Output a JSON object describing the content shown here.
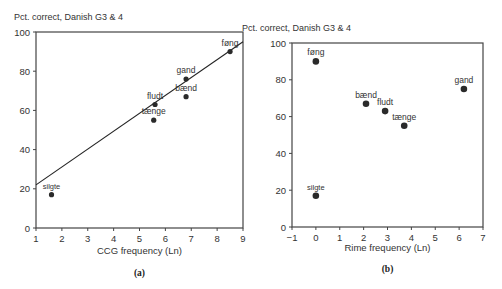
{
  "chart_data": [
    {
      "id": "a",
      "type": "scatter",
      "title": "Pct. correct, Danish G3 & 4",
      "xlabel": "CCG frequency (Ln)",
      "ylabel": "Pct. correct, Danish G3 & 4",
      "caption": "(a)",
      "xlim": [
        1,
        9
      ],
      "ylim": [
        0,
        100
      ],
      "xticks": [
        "1",
        "2",
        "3",
        "4",
        "5",
        "6",
        "7",
        "8",
        "9"
      ],
      "yticks": [
        "0",
        "20",
        "40",
        "60",
        "80",
        "100"
      ],
      "grid": false,
      "legend": "none",
      "points": [
        {
          "label": "silgte",
          "x": 1.6,
          "y": 17
        },
        {
          "label": "tænge",
          "x": 5.55,
          "y": 55
        },
        {
          "label": "fludt",
          "x": 5.6,
          "y": 63
        },
        {
          "label": "bænd",
          "x": 6.8,
          "y": 67
        },
        {
          "label": "gand",
          "x": 6.8,
          "y": 76
        },
        {
          "label": "føng",
          "x": 8.5,
          "y": 90
        }
      ],
      "regression_line": {
        "x1": 1,
        "y1": 22,
        "x2": 9,
        "y2": 95
      }
    },
    {
      "id": "b",
      "type": "scatter",
      "title": "Pct. correct, Danish G3 & 4",
      "xlabel": "Rime frequency (Ln)",
      "ylabel": "Pct. correct, Danish G3 & 4",
      "caption": "(b)",
      "xlim": [
        -1,
        7
      ],
      "ylim": [
        0,
        100
      ],
      "xticks": [
        "−1",
        "0",
        "1",
        "2",
        "3",
        "4",
        "5",
        "6",
        "7"
      ],
      "yticks": [
        "0",
        "20",
        "40",
        "60",
        "80",
        "100"
      ],
      "grid": false,
      "legend": "none",
      "points": [
        {
          "label": "føng",
          "x": 0,
          "y": 90
        },
        {
          "label": "bænd",
          "x": 2.1,
          "y": 67
        },
        {
          "label": "fludt",
          "x": 2.9,
          "y": 63
        },
        {
          "label": "tænge",
          "x": 3.7,
          "y": 55
        },
        {
          "label": "gand",
          "x": 6.2,
          "y": 75
        },
        {
          "label": "silgte",
          "x": 0,
          "y": 17
        }
      ]
    }
  ]
}
